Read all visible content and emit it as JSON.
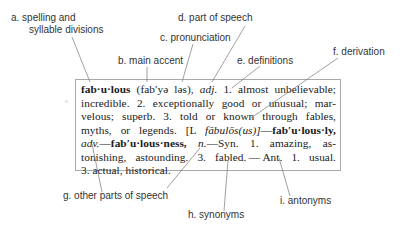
{
  "diagram": {
    "labels": {
      "a": "a. spelling and",
      "a2": "syllable divisions",
      "b": "b. main accent",
      "c": "c. pronunciation",
      "d": "d. part of speech",
      "e": "e. definitions",
      "f": "f. derivation",
      "g": "g. other parts of speech",
      "h": "h. synonyms",
      "i": "i. antonyms"
    },
    "entry": {
      "headword": "fab·u·lous",
      "pronunciation": "(fab′yə ləs),",
      "pos": "adj.",
      "line1_rest": "1. almost unbelievable;",
      "line2": "incredible. 2. exceptionally good or unusual; mar-",
      "line3": "velous; superb. 3. told or known through fables,",
      "line4_start": "myths, or legends. [L",
      "etymology": "fābulōs(us)]",
      "dash1": "—",
      "derived1": "fab′u·lous·ly,",
      "derived1_pos": "adv.",
      "dash2": "—",
      "derived2": "fab′u·lous·ness,",
      "derived2_pos": "n.",
      "syn_label": "—Syn.",
      "syn1": "1. amazing, as-",
      "line6": "tonishing, astounding. 3. fabled. — Ant. 1. usual.",
      "line7": "3. actual, historical."
    },
    "colors": {
      "label_text": "#333333",
      "entry_text": "#1a1a1a",
      "box_border": "#a8a8a8",
      "leader_line": "#777777"
    }
  }
}
